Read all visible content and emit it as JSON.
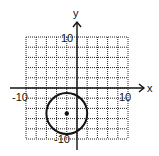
{
  "chart_data": {
    "type": "scatter",
    "title": "",
    "xlabel": "x",
    "ylabel": "y",
    "xlim": [
      -10,
      10
    ],
    "ylim": [
      -10,
      10
    ],
    "grid": true,
    "tick_labels": {
      "x": [
        "-10",
        "10"
      ],
      "y": [
        "10",
        "-10"
      ]
    },
    "shapes": [
      {
        "type": "circle",
        "center": [
          -2,
          -5
        ],
        "radius": 4
      }
    ],
    "points": [
      {
        "x": -2,
        "y": -5
      }
    ]
  },
  "labels": {
    "x_axis": "x",
    "y_axis": "y",
    "x_min": "-10",
    "x_max": "10",
    "y_max": "10",
    "y_min": "-10"
  }
}
